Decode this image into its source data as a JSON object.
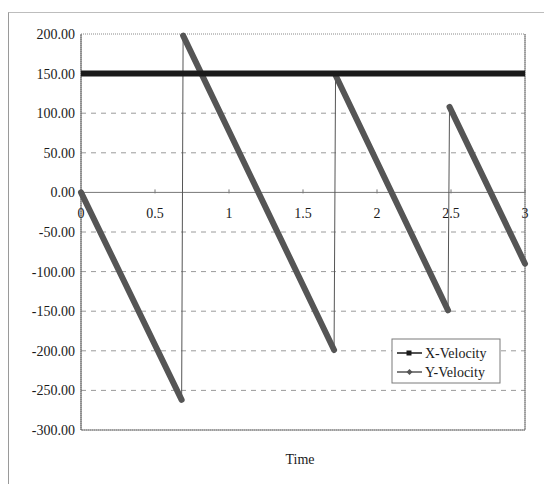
{
  "chart_data": {
    "type": "line",
    "title": "",
    "xlabel": "Time",
    "ylabel": "",
    "xlim": [
      0,
      3
    ],
    "ylim": [
      -300,
      200
    ],
    "x_ticks": [
      "0",
      "0.5",
      "1",
      "1.5",
      "2",
      "2.5",
      "3"
    ],
    "y_ticks": [
      "200.00",
      "150.00",
      "100.00",
      "50.00",
      "0.00",
      "-50.00",
      "-100.00",
      "-150.00",
      "-200.00",
      "-250.00",
      "-300.00"
    ],
    "grid": {
      "horizontal": "dashed",
      "vertical": false
    },
    "legend": {
      "position": "lower-right-inside",
      "entries": [
        "X-Velocity",
        "Y-Velocity"
      ]
    },
    "series": [
      {
        "name": "X-Velocity",
        "color": "#1a1a1a",
        "points": [
          [
            0,
            150
          ],
          [
            3,
            150
          ]
        ]
      },
      {
        "name": "Y-Velocity",
        "color": "#555555",
        "points": [
          [
            0,
            0
          ],
          [
            0.68,
            -262
          ],
          [
            0.69,
            198
          ],
          [
            1.71,
            -199
          ],
          [
            1.72,
            148
          ],
          [
            2.48,
            -149
          ],
          [
            2.49,
            108
          ],
          [
            3,
            -90
          ]
        ]
      }
    ]
  }
}
